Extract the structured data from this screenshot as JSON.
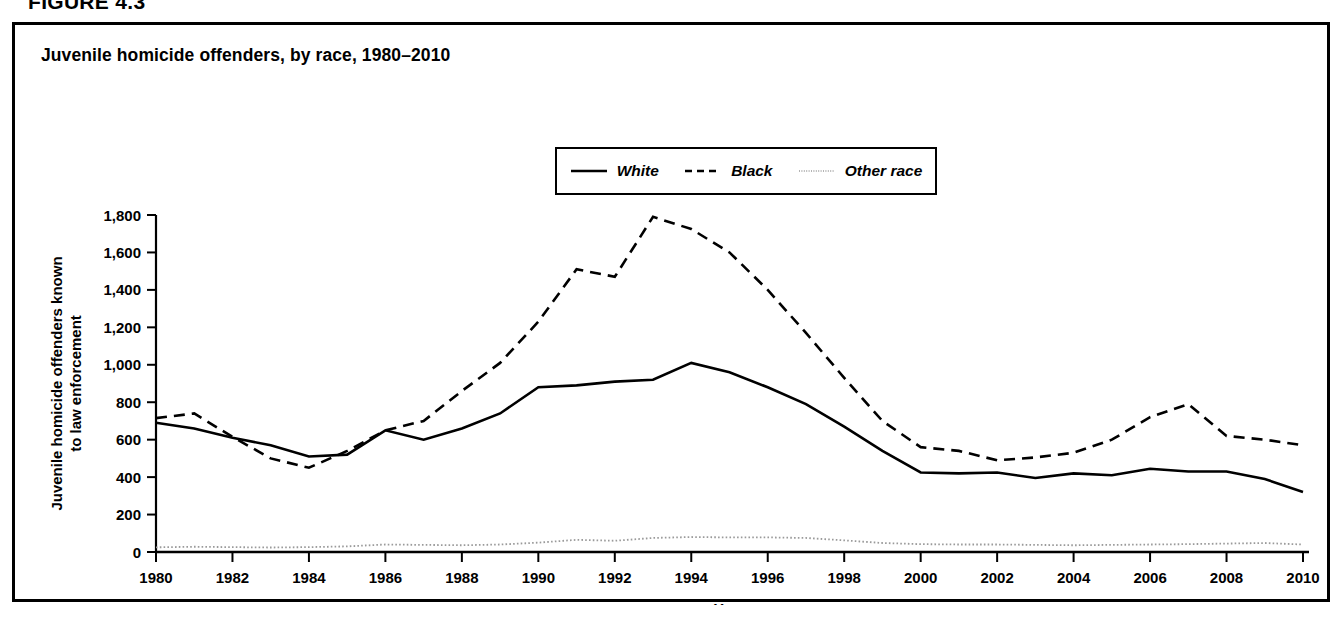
{
  "figure": {
    "number_label": "FIGURE 4.3"
  },
  "panel": {
    "title": "Juvenile homicide offenders, by race, 1980–2010"
  },
  "legend": {
    "items": [
      {
        "label": "White",
        "style": "solid",
        "color": "#000000"
      },
      {
        "label": "Black",
        "style": "dashed",
        "color": "#000000"
      },
      {
        "label": "Other race",
        "style": "dotted",
        "color": "#9a9a9a"
      }
    ]
  },
  "axes": {
    "y_label_line1": "Juvenile homicide offenders known",
    "y_label_line2": "to law enforcement",
    "x_label": "Year",
    "y_ticks": [
      "0",
      "200",
      "400",
      "600",
      "800",
      "1,000",
      "1,200",
      "1,400",
      "1,600",
      "1,800"
    ],
    "x_ticks": [
      "1980",
      "1982",
      "1984",
      "1986",
      "1988",
      "1990",
      "1992",
      "1994",
      "1996",
      "1998",
      "2000",
      "2002",
      "2004",
      "2006",
      "2008",
      "2010"
    ]
  },
  "chart_data": {
    "type": "line",
    "title": "Juvenile homicide offenders, by race, 1980–2010",
    "xlabel": "Year",
    "ylabel": "Juvenile homicide offenders known to law enforcement",
    "xlim": [
      1980,
      2010
    ],
    "ylim": [
      0,
      1800
    ],
    "ytick_interval": 200,
    "xtick_interval": 2,
    "grid": false,
    "legend_position": "top-center",
    "x": [
      1980,
      1981,
      1982,
      1983,
      1984,
      1985,
      1986,
      1987,
      1988,
      1989,
      1990,
      1991,
      1992,
      1993,
      1994,
      1995,
      1996,
      1997,
      1998,
      1999,
      2000,
      2001,
      2002,
      2003,
      2004,
      2005,
      2006,
      2007,
      2008,
      2009,
      2010
    ],
    "series": [
      {
        "name": "White",
        "style": "solid",
        "color": "#000000",
        "values": [
          690,
          660,
          610,
          570,
          510,
          520,
          650,
          600,
          660,
          740,
          880,
          890,
          910,
          920,
          1010,
          960,
          880,
          790,
          670,
          540,
          425,
          420,
          425,
          395,
          420,
          410,
          445,
          430,
          430,
          390,
          320
        ]
      },
      {
        "name": "Black",
        "style": "dashed",
        "color": "#000000",
        "values": [
          715,
          740,
          615,
          500,
          450,
          540,
          650,
          700,
          860,
          1010,
          1230,
          1510,
          1470,
          1790,
          1725,
          1600,
          1400,
          1170,
          930,
          700,
          560,
          540,
          490,
          505,
          530,
          600,
          720,
          790,
          620,
          600,
          570
        ]
      },
      {
        "name": "Other race",
        "style": "dotted",
        "color": "#9a9a9a",
        "values": [
          25,
          28,
          26,
          24,
          26,
          30,
          40,
          38,
          36,
          40,
          50,
          65,
          60,
          75,
          80,
          78,
          78,
          75,
          62,
          48,
          42,
          40,
          40,
          38,
          36,
          38,
          40,
          42,
          45,
          48,
          40
        ]
      }
    ]
  }
}
